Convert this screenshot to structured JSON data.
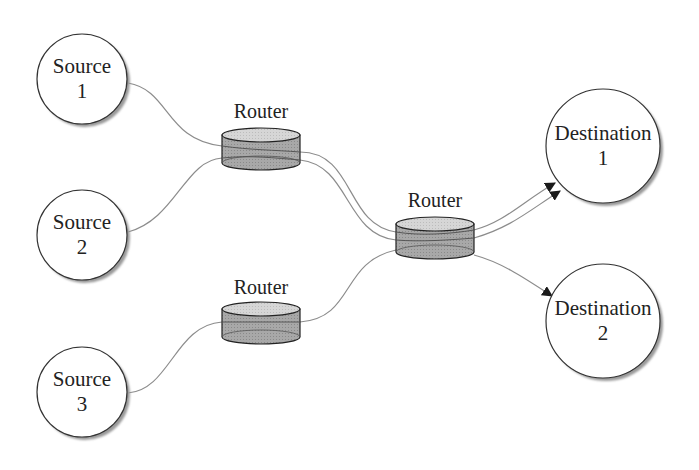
{
  "diagram": {
    "type": "network-topology",
    "sources": [
      {
        "id": "source-1",
        "line1": "Source",
        "line2": "1",
        "cx": 82,
        "cy": 79,
        "r": 45
      },
      {
        "id": "source-2",
        "line1": "Source",
        "line2": "2",
        "cx": 82,
        "cy": 235,
        "r": 45
      },
      {
        "id": "source-3",
        "line1": "Source",
        "line2": "3",
        "cx": 82,
        "cy": 392,
        "r": 45
      }
    ],
    "destinations": [
      {
        "id": "destination-1",
        "line1": "Destination",
        "line2": "1",
        "cx": 603,
        "cy": 146,
        "r": 57
      },
      {
        "id": "destination-2",
        "line1": "Destination",
        "line2": "2",
        "cx": 603,
        "cy": 321,
        "r": 57
      }
    ],
    "routers": [
      {
        "id": "router-top",
        "label": "Router",
        "cx": 261,
        "top": 131,
        "width": 78,
        "height": 36
      },
      {
        "id": "router-middle",
        "label": "Router",
        "cx": 435,
        "top": 220,
        "width": 78,
        "height": 36
      },
      {
        "id": "router-bottom",
        "label": "Router",
        "cx": 261,
        "top": 305,
        "width": 78,
        "height": 36
      }
    ],
    "connections": [
      {
        "from": "source-1",
        "to": "router-top"
      },
      {
        "from": "source-2",
        "to": "router-top"
      },
      {
        "from": "router-top",
        "to": "router-middle",
        "count": 2
      },
      {
        "from": "source-3",
        "to": "router-bottom"
      },
      {
        "from": "router-bottom",
        "to": "router-middle"
      },
      {
        "from": "router-middle",
        "to": "destination-1",
        "count": 2,
        "arrow": true
      },
      {
        "from": "router-middle",
        "to": "destination-2",
        "arrow": true
      }
    ],
    "colors": {
      "node_stroke": "#333333",
      "node_fill": "#ffffff",
      "shadow": "#9a9a9a",
      "router_body": "#a6a6a6",
      "router_top": "#d4d4d4",
      "link": "#8c8c8c",
      "arrow": "#1a1a1a"
    }
  }
}
